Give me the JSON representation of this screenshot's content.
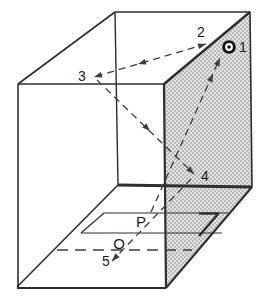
{
  "figure": {
    "name": "box-ray-diagram",
    "canvas": {
      "width": 264,
      "height": 302,
      "background": "#ffffff"
    },
    "colors": {
      "line": "#2e2e2e",
      "ray": "#3c3c3c",
      "label": "#1b1b1b",
      "stipple_bg": "#e2e2e2",
      "stipple_dot": "#969696",
      "bullseye": "#111111",
      "bullseye_ring": "#ffffff"
    },
    "shaded_face": {
      "name": "shaded-right-face",
      "points": "164,84 250,12 252,187 166,288"
    },
    "solid_lines": [
      {
        "name": "top-left-edge",
        "x1": 18,
        "y1": 84,
        "x2": 115,
        "y2": 12,
        "w": 1.6
      },
      {
        "name": "top-back-edge",
        "x1": 115,
        "y1": 12,
        "x2": 250,
        "y2": 12,
        "w": 1.6
      },
      {
        "name": "front-top-edge",
        "x1": 18,
        "y1": 84,
        "x2": 164,
        "y2": 84,
        "w": 1.6
      },
      {
        "name": "left-front-edge",
        "x1": 18,
        "y1": 84,
        "x2": 18,
        "y2": 288,
        "w": 1.6
      },
      {
        "name": "bottom-front-edge",
        "x1": 17,
        "y1": 288,
        "x2": 166,
        "y2": 288,
        "w": 1.8
      },
      {
        "name": "front-right-edge",
        "x1": 164,
        "y1": 84,
        "x2": 166,
        "y2": 288,
        "w": 2.2
      },
      {
        "name": "shaded-top-edge",
        "x1": 164,
        "y1": 84,
        "x2": 250,
        "y2": 12,
        "w": 2.4
      },
      {
        "name": "right-back-edge",
        "x1": 250,
        "y1": 12,
        "x2": 252,
        "y2": 187,
        "w": 1.6
      },
      {
        "name": "wall-floor-right-edge",
        "x1": 252,
        "y1": 187,
        "x2": 166,
        "y2": 288,
        "w": 2.0
      },
      {
        "name": "back-left-vertical-edge",
        "x1": 115,
        "y1": 12,
        "x2": 118,
        "y2": 185,
        "w": 1.4
      },
      {
        "name": "floor-back-edge",
        "x1": 118,
        "y1": 185,
        "x2": 252,
        "y2": 187,
        "w": 2.8
      },
      {
        "name": "floor-left-edge",
        "x1": 17,
        "y1": 287,
        "x2": 118,
        "y2": 185,
        "w": 1.6
      },
      {
        "name": "slit-back-edge",
        "x1": 104,
        "y1": 213,
        "x2": 230,
        "y2": 213,
        "w": 1.2
      },
      {
        "name": "slit-back-edge-dark",
        "x1": 199,
        "y1": 213.5,
        "x2": 219,
        "y2": 213.5,
        "w": 2.4
      },
      {
        "name": "slit-front-edge",
        "x1": 81,
        "y1": 233,
        "x2": 222,
        "y2": 233,
        "w": 1.2
      },
      {
        "name": "slit-left-edge",
        "x1": 81,
        "y1": 233,
        "x2": 104,
        "y2": 213,
        "w": 1.2
      },
      {
        "name": "slit-right-edge-dark",
        "x1": 199,
        "y1": 236,
        "x2": 218,
        "y2": 214,
        "w": 2.4
      }
    ],
    "dashed_lines": [
      {
        "name": "ray-2-to-3",
        "x1": 206,
        "y1": 44,
        "x2": 94,
        "y2": 77,
        "dash": "7 5",
        "w": 1.3
      },
      {
        "name": "ray-3-to-4",
        "x1": 97,
        "y1": 80,
        "x2": 194,
        "y2": 174,
        "dash": "7 5",
        "w": 1.3
      },
      {
        "name": "ray-P-to-1",
        "x1": 151,
        "y1": 212,
        "x2": 220,
        "y2": 58,
        "dash": "7 5",
        "w": 1.3
      },
      {
        "name": "ray-4-to-5",
        "x1": 191,
        "y1": 179,
        "x2": 112,
        "y2": 261,
        "dash": "7 5",
        "w": 1.3
      },
      {
        "name": "floor-dashed-line",
        "x1": 57,
        "y1": 250,
        "x2": 192,
        "y2": 250,
        "dash": "11 7",
        "w": 1.4
      }
    ],
    "arrows": [
      {
        "name": "arrowhead-to-2",
        "x": 206,
        "y": 44,
        "angle": -16.4
      },
      {
        "name": "arrowhead-mid-2-3",
        "x": 138,
        "y": 64,
        "angle": 163.6
      },
      {
        "name": "arrowhead-at-3",
        "x": 94,
        "y": 77,
        "angle": 163.6
      },
      {
        "name": "arrowhead-mid-3-4",
        "x": 150,
        "y": 131,
        "angle": 44.1
      },
      {
        "name": "arrowhead-at-4",
        "x": 194,
        "y": 174,
        "angle": 44.1
      },
      {
        "name": "arrowhead-mid-P-1",
        "x": 213,
        "y": 74,
        "angle": -65.9
      },
      {
        "name": "arrowhead-at-1",
        "x": 220,
        "y": 58,
        "angle": -65.9
      },
      {
        "name": "arrowhead-at-5",
        "x": 112,
        "y": 261,
        "angle": 133.9
      }
    ],
    "bullseye": {
      "name": "bullseye-marker",
      "cx": 229,
      "cy": 47,
      "r_outer": 6.8,
      "r_ring": 3.9,
      "r_dot": 1.8
    },
    "labels": [
      {
        "name": "label-point-1",
        "text": "1",
        "x": 243,
        "y": 47,
        "size": 14
      },
      {
        "name": "label-point-2",
        "text": "2",
        "x": 201,
        "y": 32,
        "size": 14
      },
      {
        "name": "label-point-3",
        "text": "3",
        "x": 82,
        "y": 76,
        "size": 14
      },
      {
        "name": "label-point-4",
        "text": "4",
        "x": 205,
        "y": 176,
        "size": 14
      },
      {
        "name": "label-point-5",
        "text": "5",
        "x": 106,
        "y": 261,
        "size": 14
      },
      {
        "name": "label-point-P",
        "text": "P",
        "x": 141,
        "y": 221,
        "size": 15
      },
      {
        "name": "label-point-O",
        "text": "O",
        "x": 119,
        "y": 243,
        "size": 15
      }
    ]
  }
}
